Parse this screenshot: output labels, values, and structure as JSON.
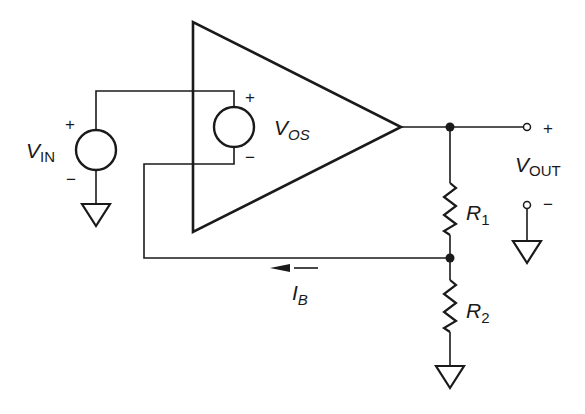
{
  "diagram": {
    "type": "op-amp circuit with input offset voltage and input bias current",
    "components": {
      "vin_source": {
        "label_main": "V",
        "label_sub": "IN",
        "plus": "+",
        "minus": "−"
      },
      "vos_source": {
        "label_main": "V",
        "label_sub": "OS",
        "plus": "+",
        "minus": "−"
      },
      "opamp": {
        "shape": "triangle"
      },
      "r1": {
        "label_main": "R",
        "label_sub": "1"
      },
      "r2": {
        "label_main": "R",
        "label_sub": "2"
      },
      "bias_current": {
        "label_main": "I",
        "label_sub": "B",
        "direction": "left"
      },
      "vout": {
        "label_main": "V",
        "label_sub": "OUT",
        "plus": "+",
        "minus": "−"
      }
    },
    "line_color": "#1a1a1a",
    "background": "#ffffff"
  }
}
